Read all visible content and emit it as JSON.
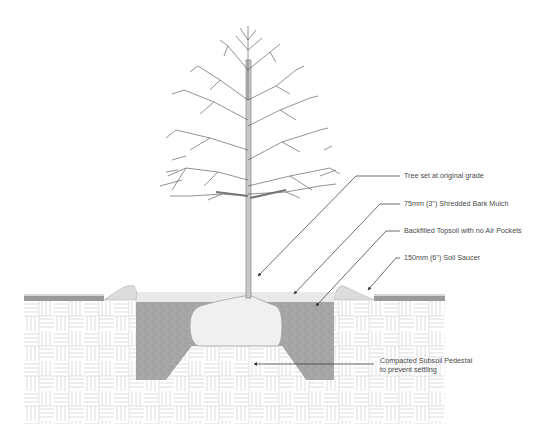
{
  "diagram": {
    "labels": [
      {
        "id": "tree-grade",
        "text": "Tree set at original grade",
        "x": 404,
        "y": 172
      },
      {
        "id": "mulch",
        "text": "75mm (3\") Shredded Bark Mulch",
        "x": 404,
        "y": 200
      },
      {
        "id": "topsoil",
        "text": "Backfilled Topsoil with no Air Pockets",
        "x": 404,
        "y": 227
      },
      {
        "id": "saucer",
        "text": "150mm (6\") Soil Saucer",
        "x": 404,
        "y": 254
      }
    ],
    "pedestal_label": {
      "line1": "Compacted Subsoil Pedestal",
      "line2": "to prevent settling"
    },
    "colors": {
      "line": "#3a3a3a",
      "topsoil": "#a9a9a9",
      "rootball": "#eeeeee",
      "saucer": "#dcdcdc",
      "subsoil_hatch": "#bdbdbd",
      "mulch": "#e4e4e4",
      "grass": "#8a8a8a",
      "trunk": "#c8c8c8"
    }
  }
}
